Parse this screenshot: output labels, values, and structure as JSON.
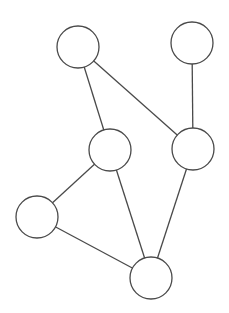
{
  "diagram": {
    "type": "undirected-graph",
    "width": 229,
    "height": 313,
    "background": "#ffffff",
    "stroke_color": "#4a4a4a",
    "stroke_width": 1.3,
    "node_fill": "#ffffff",
    "node_radius": 21,
    "nodes": [
      {
        "id": "n1",
        "x": 78,
        "y": 47,
        "label": ""
      },
      {
        "id": "n2",
        "x": 192,
        "y": 43,
        "label": ""
      },
      {
        "id": "n3",
        "x": 110,
        "y": 150,
        "label": ""
      },
      {
        "id": "n4",
        "x": 193,
        "y": 149,
        "label": ""
      },
      {
        "id": "n5",
        "x": 37,
        "y": 217,
        "label": ""
      },
      {
        "id": "n6",
        "x": 151,
        "y": 278,
        "label": ""
      }
    ],
    "edges": [
      {
        "from": "n1",
        "to": "n3"
      },
      {
        "from": "n1",
        "to": "n4"
      },
      {
        "from": "n2",
        "to": "n4"
      },
      {
        "from": "n3",
        "to": "n5"
      },
      {
        "from": "n3",
        "to": "n6"
      },
      {
        "from": "n4",
        "to": "n6"
      },
      {
        "from": "n5",
        "to": "n6"
      }
    ]
  }
}
